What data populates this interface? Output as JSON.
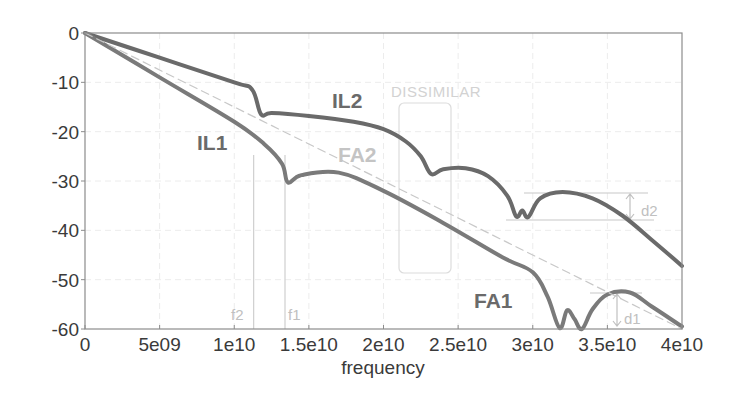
{
  "chart_data": {
    "type": "line",
    "title": "",
    "xlabel": "frequency",
    "ylabel": "",
    "xlim": [
      0,
      40000000000
    ],
    "ylim": [
      -60,
      0
    ],
    "grid": true,
    "x_ticks": [
      0,
      5000000000,
      10000000000,
      15000000000,
      20000000000,
      25000000000,
      30000000000,
      35000000000,
      40000000000
    ],
    "x_tick_labels": [
      "0",
      "5e09",
      "1e10",
      "1.5e10",
      "2e10",
      "2.5e10",
      "3e10",
      "3.5e10",
      "4e10"
    ],
    "y_ticks": [
      0,
      -10,
      -20,
      -30,
      -40,
      -50,
      -60
    ],
    "y_tick_labels": [
      "0",
      "-10",
      "-20",
      "-30",
      "-40",
      "-50",
      "-60"
    ],
    "series": [
      {
        "name": "IL2",
        "color": "#6a6a6a",
        "x": [
          0,
          5000000000.0,
          10000000000.0,
          11200000000.0,
          11800000000.0,
          12500000000.0,
          15000000000.0,
          18000000000.0,
          20000000000.0,
          21500000000.0,
          22500000000.0,
          23200000000.0,
          24000000000.0,
          25500000000.0,
          27000000000.0,
          28300000000.0,
          28900000000.0,
          29300000000.0,
          29700000000.0,
          30500000000.0,
          32000000000.0,
          34000000000.0,
          36000000000.0,
          38000000000.0,
          40000000000.0
        ],
        "values": [
          0,
          -5,
          -10,
          -11.5,
          -16.5,
          -16.2,
          -16.8,
          -18,
          -19.5,
          -22,
          -25,
          -28.6,
          -27.6,
          -27.4,
          -29,
          -33,
          -37.2,
          -36,
          -37.3,
          -33.5,
          -32.2,
          -33.5,
          -37,
          -42,
          -47.2
        ]
      },
      {
        "name": "IL1",
        "color": "#7a7a7a",
        "x": [
          0,
          5000000000.0,
          10000000000.0,
          12000000000.0,
          13200000000.0,
          13600000000.0,
          14500000000.0,
          17000000000.0,
          20000000000.0,
          24000000000.0,
          28000000000.0,
          30000000000.0,
          31000000000.0,
          31800000000.0,
          32300000000.0,
          32800000000.0,
          33300000000.0,
          34000000000.0,
          35000000000.0,
          36500000000.0,
          38000000000.0,
          40000000000.0
        ],
        "values": [
          0,
          -9,
          -18,
          -22.5,
          -26.5,
          -30.3,
          -28.8,
          -28.3,
          -32,
          -38.5,
          -45.5,
          -48.5,
          -53.5,
          -59.8,
          -56.2,
          -58,
          -60,
          -56,
          -53,
          -52.6,
          -55.5,
          -59.5
        ]
      },
      {
        "name": "FA-reference (dashed)",
        "color": "#c8c8c8",
        "x": [
          0,
          40000000000
        ],
        "values": [
          0,
          -60
        ]
      }
    ],
    "annotations": [
      {
        "text": "IL1",
        "x": 8500000000.0,
        "y": -22
      },
      {
        "text": "IL2",
        "x": 17000000000.0,
        "y": -13.5
      },
      {
        "text": "FA2",
        "x": 15500000000.0,
        "y": -25
      },
      {
        "text": "FA1",
        "x": 26500000000.0,
        "y": -55
      },
      {
        "text": "DISSIMILAR",
        "x": 21000000000.0,
        "y": -11
      },
      {
        "text": "f1",
        "x": 14000000000.0,
        "y": -58
      },
      {
        "text": "f2",
        "x": 10500000000.0,
        "y": -58
      },
      {
        "text": "d1",
        "x": 35500000000.0,
        "y": -57.5
      },
      {
        "text": "d2",
        "x": 36000000000.0,
        "y": -36
      }
    ],
    "vertical_markers": [
      {
        "label": "f2",
        "x": 11300000000.0
      },
      {
        "label": "f1",
        "x": 13400000000.0
      }
    ],
    "measurement_bands": [
      {
        "label": "d2",
        "y_top": -32.2,
        "y_bottom": -37.3
      },
      {
        "label": "d1",
        "y_top": -52.6,
        "y_bottom": -60
      }
    ],
    "legend": null
  },
  "labels": {
    "il1": "IL1",
    "il2": "IL2",
    "fa1": "FA1",
    "fa2": "FA2",
    "dissimilar": "DISSIMILAR",
    "f1": "f1",
    "f2": "f2",
    "d1": "d1",
    "d2": "d2",
    "xlabel": "frequency"
  }
}
